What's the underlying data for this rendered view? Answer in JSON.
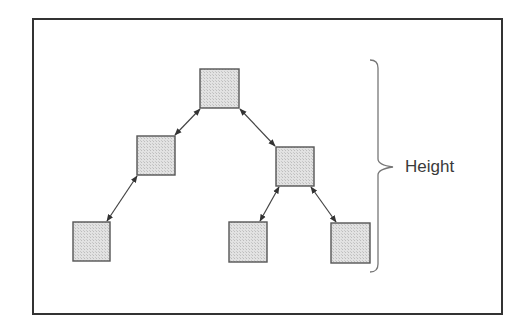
{
  "diagram": {
    "label": "Height",
    "colors": {
      "frame": "#333333",
      "node_fill": "#dcdcdc",
      "node_border": "#555555",
      "edge": "#444444",
      "brace": "#777777",
      "text": "#3a3a3a"
    },
    "nodes": [
      {
        "id": "root",
        "x": 200,
        "y": 69,
        "w": 39,
        "h": 39
      },
      {
        "id": "left",
        "x": 137,
        "y": 136,
        "w": 38,
        "h": 39
      },
      {
        "id": "right",
        "x": 276,
        "y": 147,
        "w": 38,
        "h": 39
      },
      {
        "id": "left-left",
        "x": 73,
        "y": 222,
        "w": 37,
        "h": 39
      },
      {
        "id": "right-left",
        "x": 229,
        "y": 222,
        "w": 38,
        "h": 40
      },
      {
        "id": "right-right",
        "x": 331,
        "y": 223,
        "w": 39,
        "h": 40
      }
    ],
    "edges": [
      {
        "from": "root",
        "to": "left",
        "x1": 200,
        "y1": 109,
        "x2": 175,
        "y2": 135
      },
      {
        "from": "root",
        "to": "right",
        "x1": 240,
        "y1": 109,
        "x2": 275,
        "y2": 146
      },
      {
        "from": "left",
        "to": "left-left",
        "x1": 137,
        "y1": 176,
        "x2": 107,
        "y2": 221
      },
      {
        "from": "right",
        "to": "right-left",
        "x1": 279,
        "y1": 187,
        "x2": 260,
        "y2": 221
      },
      {
        "from": "right",
        "to": "right-right",
        "x1": 311,
        "y1": 187,
        "x2": 336,
        "y2": 222
      }
    ],
    "brace": {
      "x": 378,
      "top": 60,
      "bottom": 272,
      "mid": 167,
      "tip_x": 393
    }
  }
}
